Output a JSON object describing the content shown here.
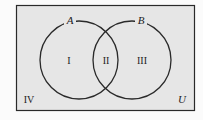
{
  "diagram": {
    "type": "venn",
    "universe_label": "U",
    "sets": [
      {
        "label": "A",
        "cx": 79,
        "cy": 60,
        "r": 39
      },
      {
        "label": "B",
        "cx": 132,
        "cy": 60,
        "r": 39
      }
    ],
    "regions": [
      {
        "id": "I",
        "label": "I",
        "x": 69,
        "y": 64
      },
      {
        "id": "II",
        "label": "II",
        "x": 106,
        "y": 64
      },
      {
        "id": "III",
        "label": "III",
        "x": 142,
        "y": 64
      },
      {
        "id": "IV",
        "label": "IV",
        "x": 29,
        "y": 103
      }
    ],
    "colors": {
      "universe_fill": "#e6e6e6",
      "stroke": "#2a2a2a"
    }
  }
}
